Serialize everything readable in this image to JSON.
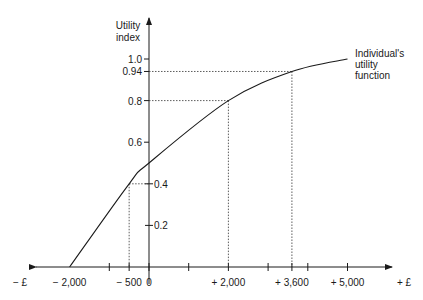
{
  "chart_data": {
    "type": "line",
    "title": "",
    "xlabel_negative": "− £",
    "xlabel_positive": "+ £",
    "ylabel": [
      "Utility",
      "index"
    ],
    "annotation": [
      "Individual's",
      "utility",
      "function"
    ],
    "xlim": [
      -2000,
      5000
    ],
    "ylim": [
      0,
      1.0
    ],
    "x_ticks": [
      {
        "value": -2000,
        "label": "− 2,000"
      },
      {
        "value": -1000,
        "label": ""
      },
      {
        "value": -500,
        "label": "− 500"
      },
      {
        "value": 0,
        "label": "0"
      },
      {
        "value": 1000,
        "label": ""
      },
      {
        "value": 2000,
        "label": "+ 2,000"
      },
      {
        "value": 3000,
        "label": ""
      },
      {
        "value": 3600,
        "label": "+ 3,600"
      },
      {
        "value": 4000,
        "label": ""
      },
      {
        "value": 5000,
        "label": "+ 5,000"
      }
    ],
    "y_ticks": [
      {
        "value": 0.2,
        "label": "0.2",
        "side": "right"
      },
      {
        "value": 0.4,
        "label": "0.4",
        "side": "right"
      },
      {
        "value": 0.6,
        "label": "0.6",
        "side": "left"
      },
      {
        "value": 0.8,
        "label": "0.8",
        "side": "left"
      },
      {
        "value": 0.94,
        "label": "0.94",
        "side": "left"
      },
      {
        "value": 1.0,
        "label": "1.0",
        "side": "left"
      }
    ],
    "series": [
      {
        "name": "Individual's utility function",
        "x": [
          -2000,
          -500,
          0,
          2000,
          3600,
          5000
        ],
        "y": [
          0.0,
          0.4,
          0.5,
          0.8,
          0.94,
          1.0
        ]
      }
    ],
    "reference_points": [
      {
        "x": -500,
        "y": 0.4
      },
      {
        "x": 2000,
        "y": 0.8
      },
      {
        "x": 3600,
        "y": 0.94
      }
    ],
    "grid": false,
    "legend": "none"
  }
}
